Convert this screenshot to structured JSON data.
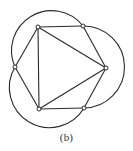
{
  "figure": {
    "caption": "(b)",
    "stroke_color": "#2a2a2a",
    "vertices": [
      {
        "id": "A",
        "x": 38,
        "y": 27
      },
      {
        "id": "B",
        "x": 83,
        "y": 26
      },
      {
        "id": "C",
        "x": 106,
        "y": 68
      },
      {
        "id": "D",
        "x": 84,
        "y": 108
      },
      {
        "id": "E",
        "x": 39,
        "y": 109
      },
      {
        "id": "F",
        "x": 15,
        "y": 67
      }
    ],
    "straight_edges": [
      [
        "A",
        "B"
      ],
      [
        "B",
        "C"
      ],
      [
        "C",
        "D"
      ],
      [
        "D",
        "E"
      ],
      [
        "E",
        "F"
      ],
      [
        "F",
        "A"
      ],
      [
        "A",
        "C"
      ],
      [
        "C",
        "E"
      ],
      [
        "E",
        "A"
      ]
    ],
    "curved_edges": [
      {
        "from": "F",
        "to": "B",
        "side": "outer-top"
      },
      {
        "from": "B",
        "to": "D",
        "side": "outer-right"
      },
      {
        "from": "D",
        "to": "F",
        "side": "outer-bottom"
      }
    ]
  }
}
